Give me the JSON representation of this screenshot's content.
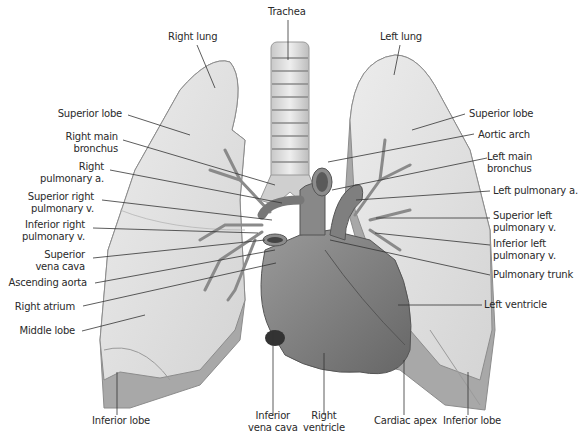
{
  "colors": {
    "background": "#ffffff",
    "lung_fill": "#e2e2e2",
    "lung_shadow": "#a9a9a9",
    "lung_outline": "#8c8c8c",
    "heart_fill": "#8a8a8a",
    "heart_dark": "#5e5e5e",
    "vessel_fill": "#7a7a7a",
    "trachea_fill": "#d8d8d8",
    "trachea_ring": "#9a9a9a",
    "leader_line": "#333333",
    "label_text": "#2a2a2a"
  },
  "labels": {
    "trachea": "Trachea",
    "right_lung": "Right lung",
    "left_lung": "Left lung",
    "superior_lobe_right": "Superior lobe",
    "superior_lobe_left": "Superior lobe",
    "right_main_bronchus": [
      "Right main",
      "bronchus"
    ],
    "aortic_arch": "Aortic arch",
    "left_main_bronchus": [
      "Left main",
      "bronchus"
    ],
    "right_pulmonary_a": [
      "Right",
      "pulmonary a."
    ],
    "left_pulmonary_a": "Left pulmonary a.",
    "superior_right_pulmonary_v": [
      "Superior right",
      "pulmonary v."
    ],
    "superior_left_pulmonary_v": [
      "Superior left",
      "pulmonary v."
    ],
    "inferior_right_pulmonary_v": [
      "Inferior right",
      "pulmonary v."
    ],
    "inferior_left_pulmonary_v": [
      "Inferior left",
      "pulmonary v."
    ],
    "superior_vena_cava": [
      "Superior",
      "vena cava"
    ],
    "ascending_aorta": "Ascending aorta",
    "pulmonary_trunk": "Pulmonary trunk",
    "right_atrium": "Right atrium",
    "left_ventricle": "Left ventricle",
    "middle_lobe": "Middle lobe",
    "inferior_lobe_right": "Inferior lobe",
    "inferior_vena_cava": [
      "Inferior",
      "vena cava"
    ],
    "right_ventricle": [
      "Right",
      "ventricle"
    ],
    "cardiac_apex": "Cardiac apex",
    "inferior_lobe_left": "Inferior lobe"
  }
}
